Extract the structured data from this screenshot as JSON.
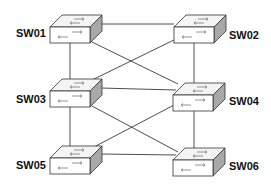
{
  "diagram": {
    "type": "network-topology",
    "colors": {
      "line": "#3a3a3a",
      "box_front": "#ffffff",
      "box_top": "#f4f4f4",
      "box_side": "#a8a8a8",
      "arrow": "#8a8a8a",
      "label": "#111111"
    },
    "nodes": [
      {
        "id": "SW01",
        "label": "SW01",
        "icon": "network-switch-icon"
      },
      {
        "id": "SW02",
        "label": "SW02",
        "icon": "network-switch-icon"
      },
      {
        "id": "SW03",
        "label": "SW03",
        "icon": "network-switch-icon"
      },
      {
        "id": "SW04",
        "label": "SW04",
        "icon": "network-switch-icon"
      },
      {
        "id": "SW05",
        "label": "SW05",
        "icon": "network-switch-icon"
      },
      {
        "id": "SW06",
        "label": "SW06",
        "icon": "network-switch-icon"
      }
    ],
    "links": [
      [
        "SW01",
        "SW02"
      ],
      [
        "SW01",
        "SW03"
      ],
      [
        "SW01",
        "SW04"
      ],
      [
        "SW02",
        "SW03"
      ],
      [
        "SW02",
        "SW04"
      ],
      [
        "SW03",
        "SW04"
      ],
      [
        "SW03",
        "SW05"
      ],
      [
        "SW03",
        "SW06"
      ],
      [
        "SW04",
        "SW05"
      ],
      [
        "SW04",
        "SW06"
      ],
      [
        "SW05",
        "SW06"
      ]
    ]
  }
}
